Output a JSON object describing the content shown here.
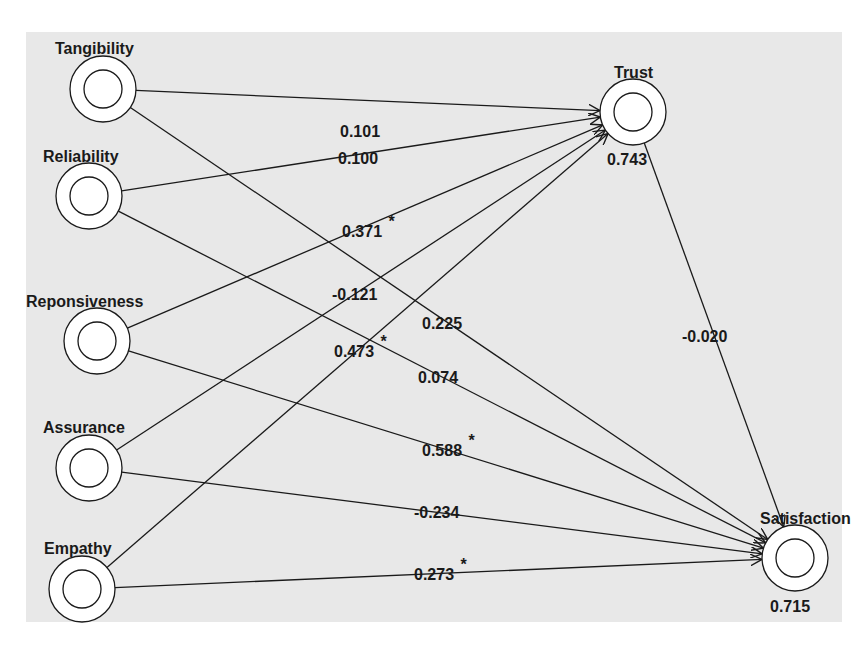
{
  "diagram": {
    "type": "path-model",
    "nodes": [
      {
        "id": "tangibility",
        "label": "Tangibility",
        "cx": 103,
        "cy": 89,
        "label_x": 55,
        "label_y": 54,
        "value": ""
      },
      {
        "id": "reliability",
        "label": "Reliability",
        "cx": 89,
        "cy": 196,
        "label_x": 43,
        "label_y": 162,
        "value": ""
      },
      {
        "id": "responsiveness",
        "label": "Reponsiveness",
        "cx": 97,
        "cy": 341,
        "label_x": 26,
        "label_y": 307,
        "value": ""
      },
      {
        "id": "assurance",
        "label": "Assurance",
        "cx": 89,
        "cy": 468,
        "label_x": 43,
        "label_y": 433,
        "value": ""
      },
      {
        "id": "empathy",
        "label": "Empathy",
        "cx": 82,
        "cy": 589,
        "label_x": 44,
        "label_y": 554,
        "value": ""
      },
      {
        "id": "trust",
        "label": "Trust",
        "cx": 633,
        "cy": 112,
        "label_x": 614,
        "label_y": 78,
        "value": "0.743",
        "value_x": 607,
        "value_y": 165
      },
      {
        "id": "satisfaction",
        "label": "Satisfaction",
        "cx": 795,
        "cy": 558,
        "label_x": 760,
        "label_y": 524,
        "value": "0.715",
        "value_x": 770,
        "value_y": 612
      }
    ],
    "edges": [
      {
        "from": "tangibility",
        "to": "trust",
        "label": "0.101",
        "significant": false,
        "lx": 340,
        "ly": 137
      },
      {
        "from": "reliability",
        "to": "trust",
        "label": "0.100",
        "significant": false,
        "lx": 338,
        "ly": 164
      },
      {
        "from": "responsiveness",
        "to": "trust",
        "label": "0.371",
        "significant": true,
        "lx": 342,
        "ly": 237
      },
      {
        "from": "assurance",
        "to": "trust",
        "label": "-0.121",
        "significant": false,
        "lx": 332,
        "ly": 300
      },
      {
        "from": "empathy",
        "to": "trust",
        "label": "0.473",
        "significant": true,
        "lx": 334,
        "ly": 357
      },
      {
        "from": "tangibility",
        "to": "satisfaction",
        "label": "0.225",
        "significant": false,
        "lx": 422,
        "ly": 329
      },
      {
        "from": "reliability",
        "to": "satisfaction",
        "label": "0.074",
        "significant": false,
        "lx": 418,
        "ly": 383
      },
      {
        "from": "responsiveness",
        "to": "satisfaction",
        "label": "0.588",
        "significant": true,
        "lx": 422,
        "ly": 456
      },
      {
        "from": "assurance",
        "to": "satisfaction",
        "label": "-0.234",
        "significant": false,
        "lx": 414,
        "ly": 518
      },
      {
        "from": "empathy",
        "to": "satisfaction",
        "label": "0.273",
        "significant": true,
        "lx": 414,
        "ly": 580
      },
      {
        "from": "trust",
        "to": "satisfaction",
        "label": "-0.020",
        "significant": false,
        "lx": 682,
        "ly": 342
      }
    ],
    "significance_marker": "*"
  },
  "colors": {
    "panel_bg": "#e8e8e8",
    "line": "#1a1a1a",
    "node_fill": "#ffffff"
  }
}
